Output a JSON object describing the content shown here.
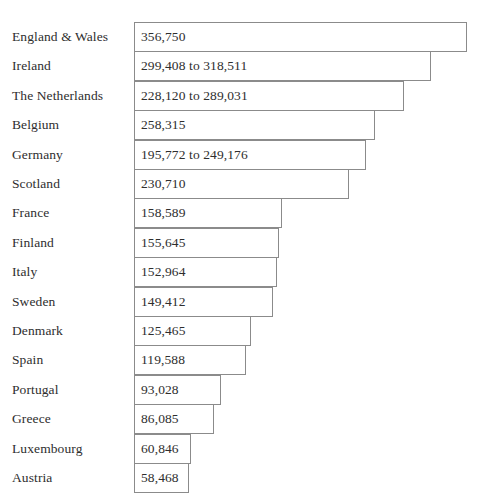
{
  "chart_data": {
    "type": "bar",
    "orientation": "horizontal",
    "title": "",
    "subtitle": "",
    "xlabel": "",
    "ylabel": "",
    "grid": false,
    "legend": null,
    "axis_visible": false,
    "value_labels_inside_bars": true,
    "xlim": [
      0,
      356750
    ],
    "categories": [
      "England & Wales",
      "Ireland",
      "The Netherlands",
      "Belgium",
      "Germany",
      "Scotland",
      "France",
      "Finland",
      "Italy",
      "Sweden",
      "Denmark",
      "Spain",
      "Portugal",
      "Greece",
      "Luxembourg",
      "Austria"
    ],
    "values": [
      356750,
      318511,
      289031,
      258315,
      249176,
      230710,
      158589,
      155645,
      152964,
      149412,
      125465,
      119588,
      93028,
      86085,
      60846,
      58468
    ],
    "value_labels": [
      "356,750",
      "299,408 to 318,511",
      "228,120 to 289,031",
      "258,315",
      "195,772 to 249,176",
      "230,710",
      "158,589",
      "155,645",
      "152,964",
      "149,412",
      "125,465",
      "119,588",
      "93,028",
      "86,085",
      "60,846",
      "58,468"
    ],
    "ranges": [
      null,
      {
        "low": 299408,
        "high": 318511
      },
      {
        "low": 228120,
        "high": 289031
      },
      null,
      {
        "low": 195772,
        "high": 249176
      },
      null,
      null,
      null,
      null,
      null,
      null,
      null,
      null,
      null,
      null,
      null
    ],
    "colors": {
      "bar_fill": "#ffffff",
      "bar_stroke": "#8b8b8b",
      "text": "#2e2e2e",
      "background": "#ffffff"
    }
  },
  "rows": [
    {
      "label": "England & Wales",
      "value_text": "356,750",
      "low": 356750,
      "high": 356750
    },
    {
      "label": "Ireland",
      "value_text": "299,408 to 318,511",
      "low": 299408,
      "high": 318511
    },
    {
      "label": "The Netherlands",
      "value_text": "228,120 to 289,031",
      "low": 228120,
      "high": 289031
    },
    {
      "label": "Belgium",
      "value_text": "258,315",
      "low": 258315,
      "high": 258315
    },
    {
      "label": "Germany",
      "value_text": "195,772 to 249,176",
      "low": 195772,
      "high": 249176
    },
    {
      "label": "Scotland",
      "value_text": "230,710",
      "low": 230710,
      "high": 230710
    },
    {
      "label": "France",
      "value_text": "158,589",
      "low": 158589,
      "high": 158589
    },
    {
      "label": "Finland",
      "value_text": "155,645",
      "low": 155645,
      "high": 155645
    },
    {
      "label": "Italy",
      "value_text": "152,964",
      "low": 152964,
      "high": 152964
    },
    {
      "label": "Sweden",
      "value_text": "149,412",
      "low": 149412,
      "high": 149412
    },
    {
      "label": "Denmark",
      "value_text": "125,465",
      "low": 125465,
      "high": 125465
    },
    {
      "label": "Spain",
      "value_text": "119,588",
      "low": 119588,
      "high": 119588
    },
    {
      "label": "Portugal",
      "value_text": "93,028",
      "low": 93028,
      "high": 93028
    },
    {
      "label": "Greece",
      "value_text": "86,085",
      "low": 86085,
      "high": 86085
    },
    {
      "label": "Luxembourg",
      "value_text": "60,846",
      "low": 60846,
      "high": 60846
    },
    {
      "label": "Austria",
      "value_text": "58,468",
      "low": 58468,
      "high": 58468
    }
  ],
  "layout": {
    "bar_origin_x": 134,
    "row_height": 30,
    "row_pitch": 29.4,
    "first_row_top": 22,
    "px_per_unit": 0.000933
  }
}
